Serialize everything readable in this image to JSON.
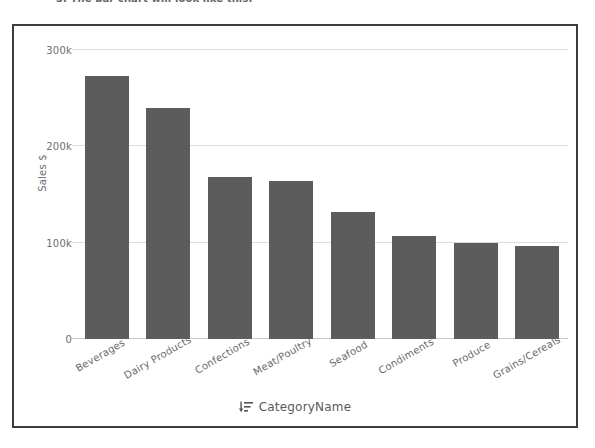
{
  "caption": "3. The bar chart will look like this:",
  "chart": {
    "xlabel_icon": "sort-descending-icon",
    "colors": {
      "bar": "#5c5c5c",
      "grid": "#dcdcdc",
      "frame": "#3d3d3d",
      "tick_text": "#6e6e6e"
    }
  },
  "chart_data": {
    "type": "bar",
    "title": "",
    "subtitle": "",
    "xlabel": "CategoryName",
    "ylabel": "Sales $",
    "categories": [
      "Beverages",
      "Dairy Products",
      "Confections",
      "Meat/Poultry",
      "Seafood",
      "Condiments",
      "Produce",
      "Grains/Cereals"
    ],
    "values": [
      273000,
      239000,
      168000,
      164000,
      132000,
      107000,
      100000,
      96000
    ],
    "ylim": [
      0,
      310000
    ],
    "yticks": [
      0,
      100000,
      200000,
      300000
    ],
    "ytick_labels": [
      "0",
      "100k",
      "200k",
      "300k"
    ],
    "grid": "horizontal",
    "legend": "none",
    "orientation": "vertical"
  }
}
